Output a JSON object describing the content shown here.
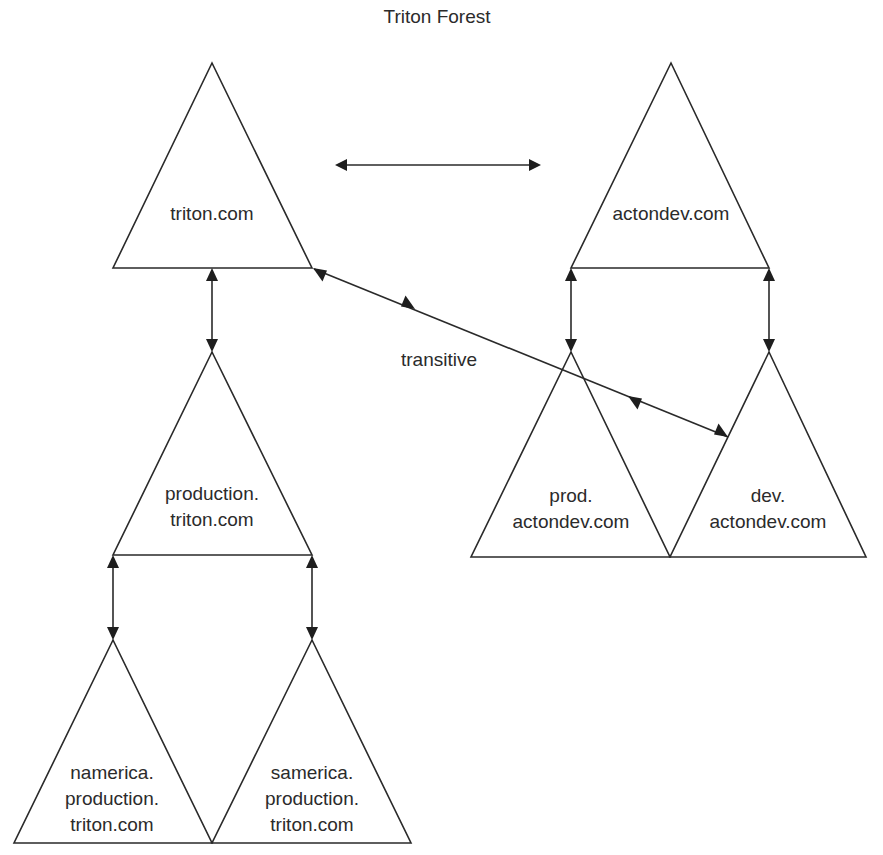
{
  "title": "Triton Forest",
  "annotation": "transitive",
  "domains": {
    "triton": {
      "lines": [
        "triton.com"
      ]
    },
    "actondev": {
      "lines": [
        "actondev.com"
      ]
    },
    "production": {
      "lines": [
        "production.",
        "triton.com"
      ]
    },
    "prod_actondev": {
      "lines": [
        "prod.",
        "actondev.com"
      ]
    },
    "dev_actondev": {
      "lines": [
        "dev.",
        "actondev.com"
      ]
    },
    "namerica": {
      "lines": [
        "namerica.",
        "production.",
        "triton.com"
      ]
    },
    "samerica": {
      "lines": [
        "samerica.",
        "production.",
        "triton.com"
      ]
    }
  },
  "trusts": [
    {
      "from": "triton.com",
      "to": "actondev.com",
      "type": "two-way"
    },
    {
      "from": "triton.com",
      "to": "production.triton.com",
      "type": "two-way"
    },
    {
      "from": "production.triton.com",
      "to": "namerica.production.triton.com",
      "type": "two-way"
    },
    {
      "from": "production.triton.com",
      "to": "samerica.production.triton.com",
      "type": "two-way"
    },
    {
      "from": "actondev.com",
      "to": "prod.actondev.com",
      "type": "two-way"
    },
    {
      "from": "actondev.com",
      "to": "dev.actondev.com",
      "type": "two-way"
    },
    {
      "from": "triton.com",
      "to": "dev.actondev.com",
      "type": "transitive"
    }
  ],
  "colors": {
    "stroke": "#2a2a2a",
    "text": "#2b2b2b",
    "background": "#ffffff"
  }
}
